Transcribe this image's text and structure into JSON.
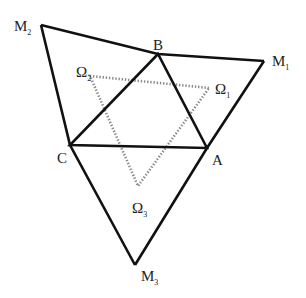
{
  "diagram": {
    "colors": {
      "background": "#ffffff",
      "solid_line": "#111111",
      "dotted_line": "#8a8a8a",
      "label": "#222222"
    },
    "points": {
      "M2": {
        "x": 41,
        "y": 25
      },
      "B": {
        "x": 158,
        "y": 54
      },
      "M1": {
        "x": 264,
        "y": 61
      },
      "C": {
        "x": 70,
        "y": 145
      },
      "A": {
        "x": 207,
        "y": 148
      },
      "M3": {
        "x": 135,
        "y": 265
      },
      "O1": {
        "x": 209,
        "y": 88
      },
      "O2": {
        "x": 90,
        "y": 76
      },
      "O3": {
        "x": 138,
        "y": 186
      }
    },
    "labels": {
      "M2": {
        "main": "M",
        "sub": "2"
      },
      "B": {
        "main": "B",
        "sub": ""
      },
      "M1": {
        "main": "M",
        "sub": "1"
      },
      "O2": {
        "main": "Ω",
        "sub": "2"
      },
      "O1": {
        "main": "Ω",
        "sub": "1"
      },
      "C": {
        "main": "C",
        "sub": ""
      },
      "A": {
        "main": "A",
        "sub": ""
      },
      "O3": {
        "main": "Ω",
        "sub": "3"
      },
      "M3": {
        "main": "M",
        "sub": "3"
      }
    },
    "solid_polygons": [
      {
        "name": "outer-triangle",
        "vertices": [
          "M2",
          "M1",
          "M3"
        ]
      },
      {
        "name": "inner-triangle",
        "vertices": [
          "A",
          "B",
          "C"
        ]
      }
    ],
    "dotted_polygons": [
      {
        "name": "napoleon-triangle",
        "vertices": [
          "O1",
          "O2",
          "O3"
        ]
      }
    ]
  }
}
